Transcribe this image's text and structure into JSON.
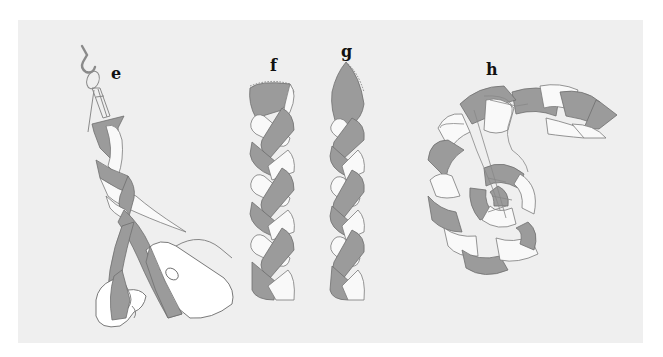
{
  "figure": {
    "colors": {
      "background": "#ffffff",
      "panel": "#efefef",
      "dark_strand": "#9b9b9b",
      "light_strand": "#f9f9f9",
      "outline": "#6f6f6f",
      "label": "#111111"
    },
    "steps": [
      {
        "label": "e",
        "caption": "Strips hung from a hook and braided by hand"
      },
      {
        "label": "f",
        "caption": "Braid end stitched flat"
      },
      {
        "label": "g",
        "caption": "Braid end stitched to a point"
      },
      {
        "label": "h",
        "caption": "Braid coiled and laced together"
      }
    ]
  }
}
